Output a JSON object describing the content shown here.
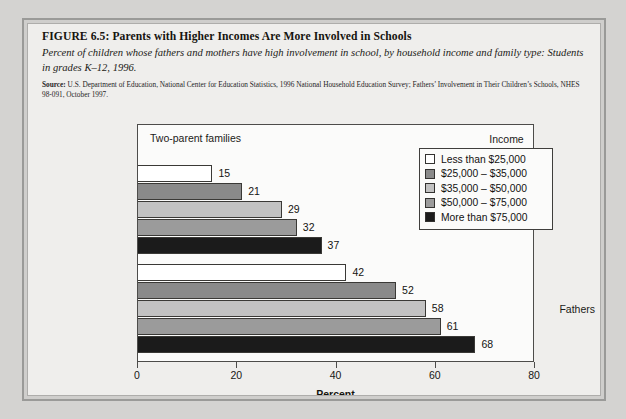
{
  "figure": {
    "title": "FIGURE 6.5:  Parents with Higher Incomes Are More Involved in Schools",
    "subtitle": "Percent of children whose fathers and mothers have high involvement in school, by household income and family type: Students in grades K–12, 1996.",
    "source_lead": "Source:",
    "source_text": " U.S. Department of Education, National Center for Education Statistics, 1996 National Household Education Survey; Fathers’ Involvement in Their Children’s Schools, NHES 98-091, October 1997."
  },
  "chart_data": {
    "type": "bar",
    "orientation": "horizontal",
    "title": "Two-parent families",
    "xlabel": "Percent",
    "ylabel": "",
    "xlim": [
      0,
      80
    ],
    "xticks": [
      0,
      20,
      40,
      60,
      80
    ],
    "grid": false,
    "legend_title": "Income",
    "legend_position": "top-right inside plot",
    "categories": [
      "Fathers",
      "Mothers"
    ],
    "series": [
      {
        "name": "Less than $25,000",
        "color": "#ffffff",
        "values": [
          15,
          42
        ]
      },
      {
        "name": "$25,000 – $35,000",
        "color": "#8a8a8a",
        "values": [
          21,
          52
        ]
      },
      {
        "name": "$35,000 – $50,000",
        "color": "#c2c2c2",
        "values": [
          29,
          58
        ]
      },
      {
        "name": "$50,000 – $75,000",
        "color": "#9b9b9b",
        "values": [
          32,
          61
        ]
      },
      {
        "name": "More than $75,000",
        "color": "#1b1b1b",
        "values": [
          37,
          68
        ]
      }
    ]
  }
}
